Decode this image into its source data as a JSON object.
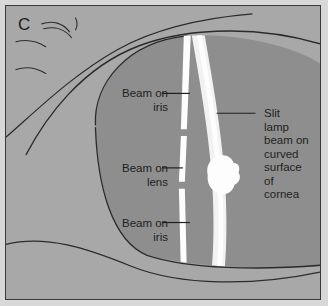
{
  "figure": {
    "panel_letter": "C",
    "type": "anatomical-illustration",
    "palette": {
      "page_background": "#d8d8d8",
      "frame_border": "#3a3a3a",
      "sclera_background": "#a8a8a8",
      "globe_iris_fill": "#8e8e8e",
      "beam_white": "#fdfdfd",
      "beam_soft_white": "#efefef",
      "outline_stroke": "#2b2b2b",
      "text_color": "#1f1f1f"
    }
  },
  "callouts": [
    {
      "id": "beam-on-iris-top",
      "text": "Beam on\niris",
      "align": "right",
      "leader_from": [
        162,
        88
      ],
      "leader_to": [
        190,
        88
      ]
    },
    {
      "id": "beam-on-lens",
      "text": "Beam on\nlens",
      "align": "right",
      "leader_from": [
        162,
        163
      ],
      "leader_to": [
        184,
        163
      ]
    },
    {
      "id": "beam-on-iris-bottom",
      "text": "Beam on\niris",
      "align": "right",
      "leader_from": [
        162,
        218
      ],
      "leader_to": [
        190,
        218
      ]
    },
    {
      "id": "slit-lamp-beam",
      "text": "Slit\nlamp\nbeam on\ncurved\nsurface\nof\ncornea",
      "align": "left",
      "leader_from": [
        215,
        108
      ],
      "leader_to": [
        256,
        108
      ]
    }
  ],
  "anatomy_parts": [
    {
      "name": "upper-eyelid-crease",
      "visible": true
    },
    {
      "name": "lower-eyelid-crease",
      "visible": true
    },
    {
      "name": "eyelashes",
      "visible": true,
      "count": 5
    },
    {
      "name": "eye-globe-outline",
      "visible": true
    },
    {
      "name": "iris-region",
      "visible": true
    },
    {
      "name": "slit-beam-on-iris-and-lens",
      "visible": true
    },
    {
      "name": "slit-beam-on-cornea",
      "visible": true
    },
    {
      "name": "corneal-light-reflex-bulge",
      "visible": true
    }
  ]
}
